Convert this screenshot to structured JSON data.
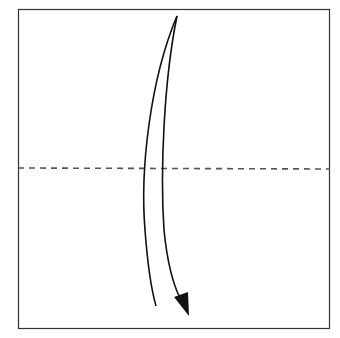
{
  "diagram": {
    "type": "origami-fold-step",
    "instruction": "valley fold top edge down to bottom edge",
    "paper": {
      "shape": "square",
      "x": 18,
      "y": 9,
      "width": 312,
      "height": 320,
      "stroke": "#333333"
    },
    "fold_line": {
      "style": "dashed",
      "y": 168,
      "color": "#555555",
      "label": "valley-fold-line"
    },
    "arrow": {
      "direction": "down",
      "color": "#111111",
      "label": "fold-direction-arrow"
    }
  }
}
